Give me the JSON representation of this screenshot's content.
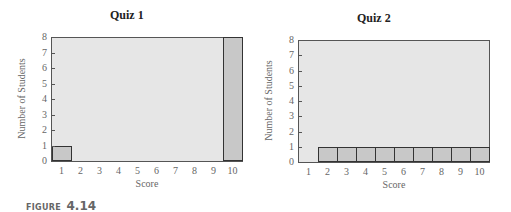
{
  "figure": {
    "label_word": "FIGURE",
    "label_number": "4.14"
  },
  "chart_data": [
    {
      "type": "bar",
      "title": "Quiz 1",
      "xlabel": "Score",
      "ylabel": "Number of Students",
      "categories": [
        "1",
        "2",
        "3",
        "4",
        "5",
        "6",
        "7",
        "8",
        "9",
        "10"
      ],
      "values": [
        1,
        0,
        0,
        0,
        0,
        0,
        0,
        0,
        0,
        8
      ],
      "ylim": [
        0,
        8
      ],
      "yticks": [
        "0",
        "1",
        "2",
        "3",
        "4",
        "5",
        "6",
        "7",
        "8"
      ],
      "grid": false,
      "legend": null
    },
    {
      "type": "bar",
      "title": "Quiz 2",
      "xlabel": "Score",
      "ylabel": "Number of Students",
      "categories": [
        "1",
        "2",
        "3",
        "4",
        "5",
        "6",
        "7",
        "8",
        "9",
        "10"
      ],
      "values": [
        0,
        1,
        1,
        1,
        1,
        1,
        1,
        1,
        1,
        1
      ],
      "ylim": [
        0,
        8
      ],
      "yticks": [
        "0",
        "1",
        "2",
        "3",
        "4",
        "5",
        "6",
        "7",
        "8"
      ],
      "grid": false,
      "legend": null
    }
  ],
  "colors": {
    "plot_background": "#e6e6e6",
    "bar_fill": "#c8c8c8",
    "bar_edge": "#333333"
  }
}
